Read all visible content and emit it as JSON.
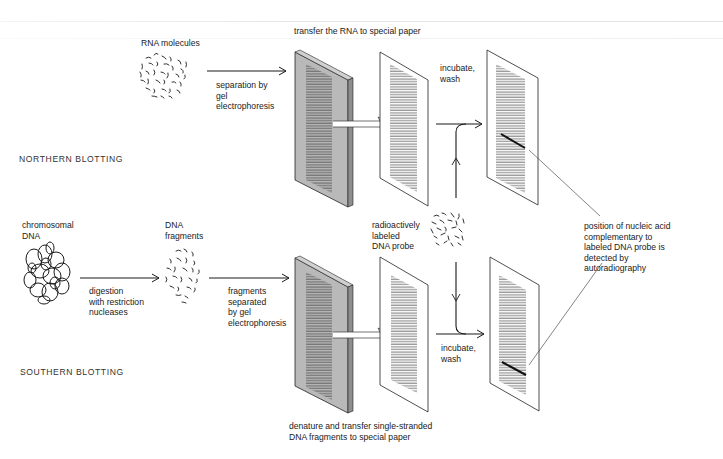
{
  "figure": {
    "colors": {
      "ink": "#1a1a1a",
      "gel_fill": "#b8b8b8",
      "gel_side": "#9a9a9a",
      "paper_fill": "#ffffff",
      "band": "#111111"
    }
  },
  "northern": {
    "title": "NORTHERN BLOTTING",
    "sample_label": "RNA molecules",
    "step1_label": "separation by\ngel\nelectrophoresis",
    "transfer_label": "transfer the RNA to special paper",
    "incubate_label": "incubate,\nwash"
  },
  "southern": {
    "title": "SOUTHERN BLOTTING",
    "sample_label": "chromosomal\nDNA",
    "digest_label": "digestion\nwith restriction\nnucleases",
    "fragments_label": "DNA\nfragments",
    "step1_label": "fragments\nseparated\nby gel\nelectrophoresis",
    "transfer_label": "denature and transfer single-stranded\nDNA fragments to special paper",
    "incubate_label": "incubate,\nwash"
  },
  "shared": {
    "probe_label": "radioactively\nlabeled\nDNA probe",
    "result_label": "position of nucleic acid\ncomplementary to\nlabeled DNA probe is\ndetected by\nautoradiography"
  },
  "icons": {
    "rna": "rna-molecules-icon",
    "chromosomal_dna": "chromosomal-dna-tangle-icon",
    "dna_fragments": "dna-fragments-icon",
    "probe": "dna-probe-icon",
    "gel": "gel-slab-icon",
    "paper": "blot-paper-icon",
    "autorad": "autoradiograph-icon"
  }
}
